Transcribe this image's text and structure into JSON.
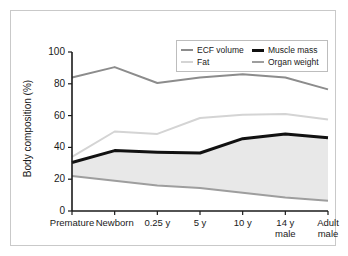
{
  "figure": {
    "background_color": "#ffffff",
    "frame_color": "#c9c9c9"
  },
  "chart_data": {
    "type": "line",
    "title": "",
    "subtitle": "",
    "xlabel": "",
    "ylabel": "Body composition (%)",
    "categories": [
      "Premature",
      "Newborn",
      "0.25 y",
      "5 y",
      "10 y",
      "14 y\nmale",
      "Adult\nmale"
    ],
    "category_labels": [
      {
        "line1": "Premature",
        "line2": ""
      },
      {
        "line1": "Newborn",
        "line2": ""
      },
      {
        "line1": "0.25 y",
        "line2": ""
      },
      {
        "line1": "5 y",
        "line2": ""
      },
      {
        "line1": "10 y",
        "line2": ""
      },
      {
        "line1": "14 y",
        "line2": "male"
      },
      {
        "line1": "Adult",
        "line2": "male"
      }
    ],
    "ylim": [
      0,
      100
    ],
    "yticks": [
      0,
      20,
      40,
      60,
      80,
      100
    ],
    "ytick_labels": [
      "0",
      "20",
      "40",
      "60",
      "80",
      "100"
    ],
    "grid": false,
    "legend_position": "top-right",
    "series": [
      {
        "name": "ECF volume",
        "color": "#8c8c8c",
        "width": 2.0,
        "values": [
          84,
          90.5,
          80.5,
          84,
          86,
          84,
          76.5
        ]
      },
      {
        "name": "Fat",
        "color": "#d4d4d4",
        "width": 2.0,
        "values": [
          34,
          50,
          48.5,
          58.5,
          60.5,
          61,
          57.5
        ]
      },
      {
        "name": "Muscle mass",
        "color": "#111111",
        "width": 3.0,
        "values": [
          30.5,
          38,
          37,
          36.5,
          45.5,
          48.5,
          46
        ]
      },
      {
        "name": "Organ weight",
        "color": "#9e9e9e",
        "width": 2.0,
        "values": [
          22,
          19,
          16,
          14.5,
          11.5,
          8.5,
          6.5
        ]
      }
    ],
    "shaded_band": {
      "upper_series": "Muscle mass",
      "lower_series": "Organ weight",
      "fill_color": "#e8e8e8"
    },
    "legend": {
      "rows": [
        [
          {
            "label": "ECF volume",
            "color": "#8c8c8c",
            "width": 2.0
          },
          {
            "label": "Muscle mass",
            "color": "#111111",
            "width": 3.0
          }
        ],
        [
          {
            "label": "Fat",
            "color": "#d4d4d4",
            "width": 2.0
          },
          {
            "label": "Organ weight",
            "color": "#9e9e9e",
            "width": 2.0
          }
        ]
      ]
    },
    "axis_color": "#1a1a1a"
  }
}
